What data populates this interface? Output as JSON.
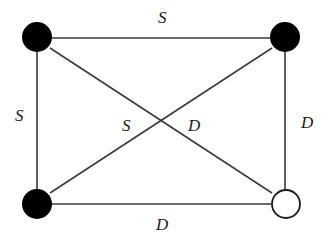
{
  "diagram": {
    "type": "graph",
    "nodes": [
      {
        "id": "top-left",
        "x": 37,
        "y": 37,
        "r": 15,
        "style": "filled"
      },
      {
        "id": "top-right",
        "x": 285,
        "y": 37,
        "r": 15,
        "style": "filled"
      },
      {
        "id": "bottom-left",
        "x": 37,
        "y": 204,
        "r": 15,
        "style": "filled"
      },
      {
        "id": "bottom-right",
        "x": 286,
        "y": 204,
        "r": 15,
        "style": "open"
      }
    ],
    "edges": [
      {
        "from": "top-left",
        "to": "top-right",
        "label": "S"
      },
      {
        "from": "top-left",
        "to": "bottom-left",
        "label": "S"
      },
      {
        "from": "bottom-left",
        "to": "top-right",
        "label": "S"
      },
      {
        "from": "top-left",
        "to": "bottom-right",
        "label": "D"
      },
      {
        "from": "top-right",
        "to": "bottom-right",
        "label": "D"
      },
      {
        "from": "bottom-left",
        "to": "bottom-right",
        "label": "D"
      }
    ],
    "labels": {
      "top": "S",
      "left": "S",
      "diag_s": "S",
      "diag_d": "D",
      "right": "D",
      "bottom": "D"
    }
  }
}
